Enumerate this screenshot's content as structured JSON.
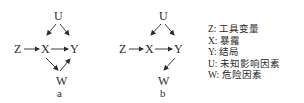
{
  "diagrams": [
    {
      "caption": "a",
      "nodes": {
        "U": "U",
        "Z": "Z",
        "X": "X",
        "Y": "Y",
        "W": "W"
      },
      "edges": [
        [
          "U",
          "X"
        ],
        [
          "U",
          "Y"
        ],
        [
          "Z",
          "X"
        ],
        [
          "X",
          "Y"
        ],
        [
          "X",
          "W"
        ],
        [
          "W",
          "Y"
        ]
      ]
    },
    {
      "caption": "b",
      "nodes": {
        "U": "U",
        "Z": "Z",
        "X": "X",
        "Y": "Y",
        "W": "W"
      },
      "edges": [
        [
          "U",
          "X"
        ],
        [
          "U",
          "Y"
        ],
        [
          "Z",
          "X"
        ],
        [
          "X",
          "Y"
        ],
        [
          "Y",
          "W"
        ]
      ]
    }
  ],
  "legend": [
    {
      "key": "Z:",
      "label": "工具变量"
    },
    {
      "key": "X:",
      "label": "暴露"
    },
    {
      "key": "Y:",
      "label": "结局"
    },
    {
      "key": "U:",
      "label": "未知影响因素"
    },
    {
      "key": "W:",
      "label": "危险因素"
    }
  ]
}
